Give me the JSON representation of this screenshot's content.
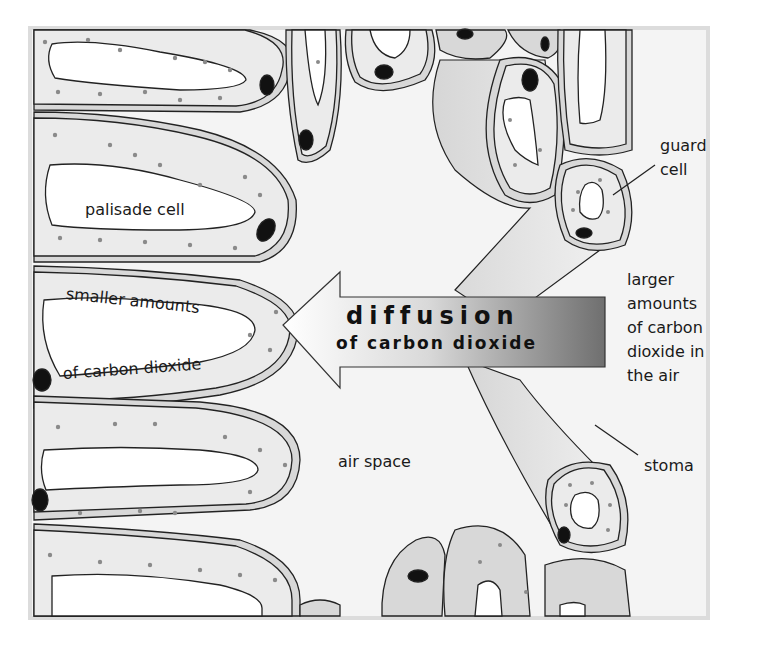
{
  "diagram": {
    "arrow": {
      "line1": "diffusion",
      "line2": "of carbon dioxide",
      "direction": "left"
    },
    "labels": {
      "palisade_cell": "palisade cell",
      "smaller_amounts_1": "smaller amounts",
      "smaller_amounts_2": "of carbon dioxide",
      "air_space": "air space",
      "guard_cell_1": "guard",
      "guard_cell_2": "cell",
      "larger_1": "larger",
      "larger_2": "amounts",
      "larger_3": "of carbon",
      "larger_4": "dioxide in",
      "larger_5": "the air",
      "stoma": "stoma"
    },
    "colors": {
      "background": "#f4f4f4",
      "frame": "#dcdcdc",
      "cytoplasm": "#ebebeb",
      "cell_wall": "#d8d8d8",
      "vacuole": "#ffffff",
      "nucleus": "#111111",
      "chloroplast": "#8a8a8a",
      "arrow_dark": "#6f6f6f",
      "arrow_light": "#ffffff"
    }
  }
}
